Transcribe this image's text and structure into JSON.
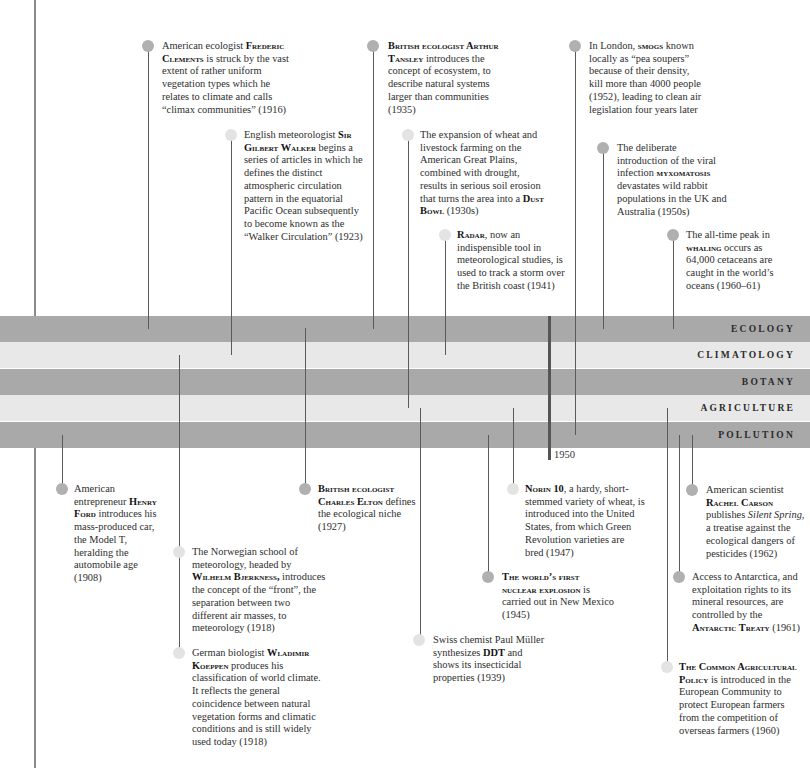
{
  "timeline": {
    "bands": [
      {
        "label": "ECOLOGY",
        "tone": "dark"
      },
      {
        "label": "CLIMATOLOGY",
        "tone": "light"
      },
      {
        "label": "BOTANY",
        "tone": "dark"
      },
      {
        "label": "AGRICULTURE",
        "tone": "light"
      },
      {
        "label": "POLLUTION",
        "tone": "dark"
      }
    ],
    "marker_label": "1950"
  },
  "colors": {
    "band_dark": "#a9a9a9",
    "band_light": "#e8e8e8",
    "dot_dark": "#b0b0b0",
    "dot_light": "#e3e3e3",
    "connector": "#5a5a5a"
  },
  "events": [
    {
      "category": "Ecology",
      "segments": [
        {
          "text": "American ecologist "
        },
        {
          "text": "Frederic Clements",
          "style": "smallcaps-bold"
        },
        {
          "text": " is struck by the vast extent of rather uniform vegetation types which he relates to climate and calls “climax communities” (1916)"
        }
      ]
    },
    {
      "category": "Climatology",
      "segments": [
        {
          "text": "English meteorologist "
        },
        {
          "text": "Sir Gilbert Walker",
          "style": "smallcaps-bold"
        },
        {
          "text": " begins a series of articles in which he defines the distinct atmospheric circulation pattern in the equatorial Pacific Ocean subsequently to become known as the “Walker Circulation” (1923)"
        }
      ]
    },
    {
      "category": "Ecology",
      "segments": [
        {
          "text": "British ecologist Arthur Tansley",
          "style": "smallcaps-bold"
        },
        {
          "text": " introduces the concept of ecosystem, to describe natural systems larger than communities (1935)"
        }
      ]
    },
    {
      "category": "Agriculture",
      "segments": [
        {
          "text": "The expansion of wheat and livestock farming on the American Great Plains, combined with drought, results in serious soil erosion that turns the area into a "
        },
        {
          "text": "Dust Bowl",
          "style": "smallcaps-bold"
        },
        {
          "text": " (1930s)"
        }
      ]
    },
    {
      "category": "Climatology",
      "segments": [
        {
          "text": "Radar",
          "style": "smallcaps-bold"
        },
        {
          "text": ", now an indispensible tool in meteorological studies, is used to track a storm over the British coast (1941)"
        }
      ]
    },
    {
      "category": "Pollution",
      "segments": [
        {
          "text": "In London, "
        },
        {
          "text": "smogs",
          "style": "smallcaps-bold"
        },
        {
          "text": " known locally as “pea soupers” because of their density, kill more than 4000 people (1952), leading to clean air legislation four years later"
        }
      ]
    },
    {
      "category": "Ecology",
      "segments": [
        {
          "text": "The deliberate introduction of the viral infection "
        },
        {
          "text": "myxomatosis",
          "style": "smallcaps-bold"
        },
        {
          "text": " devastates wild rabbit populations in the UK and Australia (1950s)"
        }
      ]
    },
    {
      "category": "Ecology",
      "segments": [
        {
          "text": "The all-time peak in "
        },
        {
          "text": "whaling",
          "style": "smallcaps-bold"
        },
        {
          "text": " occurs as 64,000 cetaceans are caught in the world’s oceans (1960–61)"
        }
      ]
    },
    {
      "category": "Pollution",
      "segments": [
        {
          "text": "American entrepreneur "
        },
        {
          "text": "Henry Ford",
          "style": "smallcaps-bold"
        },
        {
          "text": " introduces his mass-produced car, the Model T, heralding the automobile age (1908)"
        }
      ]
    },
    {
      "category": "Climatology",
      "segments": [
        {
          "text": "The Norwegian school of meteorology, headed by "
        },
        {
          "text": "Wilhelm Bjerkness,",
          "style": "smallcaps-bold"
        },
        {
          "text": " introduces the concept of the “front”, the separation between two different air masses, to meteorology (1918)"
        }
      ]
    },
    {
      "category": "Climatology",
      "segments": [
        {
          "text": "German biologist "
        },
        {
          "text": "Wladimir Koeppen",
          "style": "smallcaps-bold"
        },
        {
          "text": " produces his classification of world climate. It reflects the general coincidence between natural vegetation forms and climatic conditions and is still widely used today (1918)"
        }
      ]
    },
    {
      "category": "Ecology",
      "segments": [
        {
          "text": "British ecologist Charles Elton",
          "style": "smallcaps-bold"
        },
        {
          "text": " defines the ecological niche (1927)"
        }
      ]
    },
    {
      "category": "Agriculture",
      "segments": [
        {
          "text": "Swiss chemist Paul Müller synthesizes "
        },
        {
          "text": "DDT",
          "style": "bold"
        },
        {
          "text": " and shows its insecticidal properties (1939)"
        }
      ]
    },
    {
      "category": "Pollution",
      "segments": [
        {
          "text": "The world’s first nuclear explosion",
          "style": "smallcaps-bold"
        },
        {
          "text": " is carried out in New Mexico (1945)"
        }
      ]
    },
    {
      "category": "Agriculture",
      "segments": [
        {
          "text": "Norin 10",
          "style": "smallcaps-bold"
        },
        {
          "text": ", a hardy, short-stemmed variety of wheat, is introduced into the United States, from which Green Revolution varieties are bred (1947)"
        }
      ]
    },
    {
      "category": "Agriculture",
      "segments": [
        {
          "text": "The Common Agricultural Policy",
          "style": "smallcaps-bold"
        },
        {
          "text": " is introduced in the European Community to protect European farmers from the competition of overseas farmers (1960)"
        }
      ]
    },
    {
      "category": "Pollution",
      "segments": [
        {
          "text": "Access to Antarctica, and exploitation rights to its mineral resources, are controlled by the "
        },
        {
          "text": "Antarctic Treaty",
          "style": "smallcaps-bold"
        },
        {
          "text": " (1961)"
        }
      ]
    },
    {
      "category": "Pollution",
      "segments": [
        {
          "text": "American scientist "
        },
        {
          "text": "Rachel Carson",
          "style": "smallcaps-bold"
        },
        {
          "text": " publishes "
        },
        {
          "text": "Silent Spring",
          "style": "italic"
        },
        {
          "text": ", a treatise against the ecological dangers of pesticides (1962)"
        }
      ]
    }
  ]
}
